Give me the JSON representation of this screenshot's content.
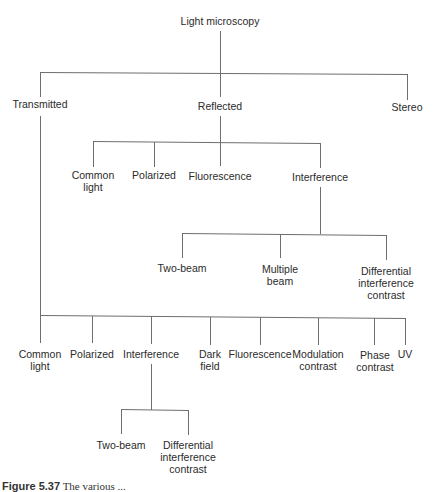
{
  "diagram": {
    "type": "tree",
    "line_color": "#6e6e6e",
    "root": {
      "label": "Light microscopy",
      "children": [
        {
          "label": "Transmitted",
          "children": [
            {
              "label": "Common light",
              "lines": [
                "Common",
                "light"
              ]
            },
            {
              "label": "Polarized",
              "lines": [
                "Polarized"
              ]
            },
            {
              "label": "Interference",
              "lines": [
                "Interference"
              ],
              "children": [
                {
                  "label": "Two-beam",
                  "lines": [
                    "Two-beam"
                  ]
                },
                {
                  "label": "Differential interference contrast",
                  "lines": [
                    "Differential",
                    "interference",
                    "contrast"
                  ]
                }
              ]
            },
            {
              "label": "Dark field",
              "lines": [
                "Dark",
                "field"
              ]
            },
            {
              "label": "Fluorescence",
              "lines": [
                "Fluorescence"
              ]
            },
            {
              "label": "Modulation contrast",
              "lines": [
                "Modulation",
                "contrast"
              ]
            },
            {
              "label": "Phase contrast",
              "lines": [
                "Phase",
                "contrast"
              ]
            },
            {
              "label": "UV",
              "lines": [
                "UV"
              ]
            }
          ]
        },
        {
          "label": "Reflected",
          "children": [
            {
              "label": "Common light",
              "lines": [
                "Common",
                "light"
              ]
            },
            {
              "label": "Polarized",
              "lines": [
                "Polarized"
              ]
            },
            {
              "label": "Fluorescence",
              "lines": [
                "Fluorescence"
              ]
            },
            {
              "label": "Interference",
              "lines": [
                "Interference"
              ],
              "children": [
                {
                  "label": "Two-beam",
                  "lines": [
                    "Two-beam"
                  ]
                },
                {
                  "label": "Multiple beam",
                  "lines": [
                    "Multiple",
                    "beam"
                  ]
                },
                {
                  "label": "Differential interference contrast",
                  "lines": [
                    "Differential",
                    "interference",
                    "contrast"
                  ]
                }
              ]
            }
          ]
        },
        {
          "label": "Stereo"
        }
      ]
    }
  },
  "labels": {
    "root": "Light microscopy",
    "transmitted": "Transmitted",
    "reflected": "Reflected",
    "stereo": "Stereo",
    "refl_common_1": "Common",
    "refl_common_2": "light",
    "refl_polarized": "Polarized",
    "refl_fluorescence": "Fluorescence",
    "refl_interference": "Interference",
    "refl_int_twobeam": "Two-beam",
    "refl_int_multiple_1": "Multiple",
    "refl_int_multiple_2": "beam",
    "refl_int_dic_1": "Differential",
    "refl_int_dic_2": "interference",
    "refl_int_dic_3": "contrast",
    "trans_common_1": "Common",
    "trans_common_2": "light",
    "trans_polarized": "Polarized",
    "trans_interference": "Interference",
    "trans_dark_1": "Dark",
    "trans_dark_2": "field",
    "trans_fluorescence": "Fluorescence",
    "trans_modulation_1": "Modulation",
    "trans_modulation_2": "contrast",
    "trans_phase_1": "Phase",
    "trans_phase_2": "contrast",
    "trans_uv": "UV",
    "trans_int_twobeam": "Two-beam",
    "trans_int_dic_1": "Differential",
    "trans_int_dic_2": "interference",
    "trans_int_dic_3": "contrast"
  },
  "caption": {
    "label": "Figure 5.37",
    "text": "The various ..."
  }
}
